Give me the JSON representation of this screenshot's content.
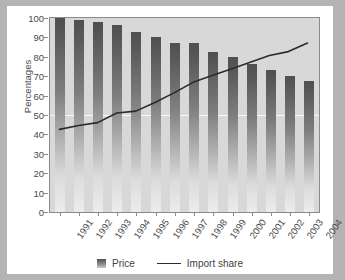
{
  "chart_data": {
    "type": "bar",
    "title": "",
    "xlabel": "",
    "ylabel": "Percentages",
    "ylim": [
      0,
      100
    ],
    "yticks": [
      0,
      10,
      20,
      30,
      40,
      50,
      60,
      70,
      80,
      90,
      100
    ],
    "grid": false,
    "legend_position": "bottom",
    "categories": [
      "1991",
      "1992",
      "1993",
      "1994",
      "1995",
      "1996",
      "1997",
      "1998",
      "1999",
      "2000",
      "2001",
      "2002",
      "2003",
      "2004"
    ],
    "series": [
      {
        "name": "Price",
        "type": "bar",
        "values": [
          100,
          99,
          98,
          96.5,
          93,
          90,
          87,
          87,
          82.5,
          80,
          76.5,
          73,
          70,
          67.5
        ]
      },
      {
        "name": "Import share",
        "type": "line",
        "values": [
          42,
          44,
          45.5,
          50.5,
          51.5,
          56,
          61,
          66.5,
          70,
          73.5,
          77,
          80.5,
          82.5,
          87
        ]
      }
    ]
  },
  "legend": {
    "bar_label": "Price",
    "line_label": "Import share"
  },
  "colors": {
    "bar_top": "#4f4f4f",
    "bar_bottom": "#ececec",
    "line": "#2b2b2b",
    "plot_bg": "#d8d8d8",
    "page_bg": "#b4b4b4",
    "frame_bg": "#ffffff",
    "axis": "#8a8a8a",
    "text": "#4a4a4a"
  }
}
